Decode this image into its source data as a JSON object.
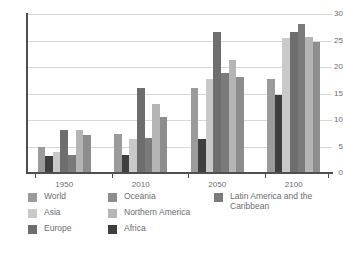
{
  "chart_data": {
    "type": "bar",
    "title": "",
    "xlabel": "",
    "ylabel": "",
    "ylim": [
      0,
      30
    ],
    "yticks": [
      0,
      5,
      10,
      15,
      20,
      25,
      30
    ],
    "grid": true,
    "legend_position": "bottom",
    "categories": [
      "1950",
      "2010",
      "2050",
      "2100"
    ],
    "series": [
      {
        "name": "World",
        "color": "#9b9b9b",
        "values": [
          5.0,
          7.4,
          16.1,
          17.8
        ]
      },
      {
        "name": "Asia",
        "color": "#c9c9c9",
        "values": [
          4.0,
          6.5,
          17.7,
          25.4
        ]
      },
      {
        "name": "Europe",
        "color": "#6e6e6e",
        "values": [
          8.1,
          16.1,
          26.7,
          26.7
        ]
      },
      {
        "name": "Oceania",
        "color": "#8d8d8d",
        "values": [
          7.2,
          10.5,
          18.1,
          24.7
        ]
      },
      {
        "name": "Northern America",
        "color": "#b5b5b5",
        "values": [
          8.1,
          13.0,
          21.4,
          25.6
        ]
      },
      {
        "name": "Africa",
        "color": "#3f3f3f",
        "values": [
          3.2,
          3.4,
          6.4,
          14.7
        ]
      },
      {
        "name": "Latin America and the Caribbean",
        "color": "#7a7a7a",
        "values": [
          3.4,
          6.7,
          18.9,
          28.1
        ]
      }
    ],
    "bar_order": [
      "World",
      "Africa",
      "Asia",
      "Europe",
      "Latin America and the Caribbean",
      "Northern America",
      "Oceania"
    ]
  },
  "legend": {
    "columns": [
      [
        {
          "label": "World",
          "color": "#9b9b9b"
        },
        {
          "label": "Asia",
          "color": "#c9c9c9"
        },
        {
          "label": "Europe",
          "color": "#6e6e6e"
        }
      ],
      [
        {
          "label": "Oceania",
          "color": "#8d8d8d"
        },
        {
          "label": "Northern America",
          "color": "#b5b5b5"
        },
        {
          "label": "Africa",
          "color": "#3f3f3f"
        }
      ],
      [
        {
          "label": "Latin America and the Caribbean",
          "color": "#7a7a7a"
        }
      ]
    ]
  },
  "axis": {
    "y_tick_labels": [
      "30",
      "25",
      "20",
      "15",
      "10",
      "5",
      "0"
    ],
    "x_tick_labels": [
      "1950",
      "2010",
      "2050",
      "2100"
    ]
  },
  "colors": {
    "axis": "#4f4f4f",
    "grid": "#d8d8d8",
    "text": "#6c6d70",
    "background": "#ffffff"
  }
}
